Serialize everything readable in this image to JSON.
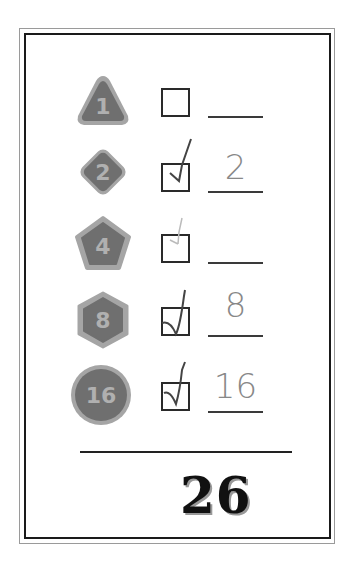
{
  "worksheet": {
    "rows": [
      {
        "badge_number": "1",
        "badge_shape": "triangle",
        "checked": false,
        "check_strength": "none",
        "answer": ""
      },
      {
        "badge_number": "2",
        "badge_shape": "diamond",
        "checked": true,
        "check_strength": "full",
        "answer": "2"
      },
      {
        "badge_number": "4",
        "badge_shape": "pentagon",
        "checked": true,
        "check_strength": "faint",
        "answer": ""
      },
      {
        "badge_number": "8",
        "badge_shape": "hexagon",
        "checked": true,
        "check_strength": "full",
        "answer": "8"
      },
      {
        "badge_number": "16",
        "badge_shape": "circle",
        "checked": true,
        "check_strength": "full",
        "answer": "16"
      }
    ],
    "total": "26"
  },
  "colors": {
    "badge_fill": "#6f6f6f",
    "badge_rim": "#a5a5a5",
    "badge_text": "#b0b0b0",
    "frame_outer": "#9a9a9a",
    "frame_inner": "#1a1a1a"
  }
}
